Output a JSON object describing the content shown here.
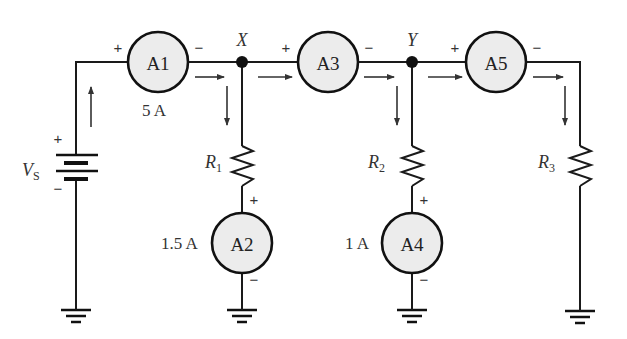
{
  "diagram": {
    "type": "circuit-schematic",
    "source": {
      "label": "V",
      "subscript": "S",
      "plus": "+",
      "minus": "−"
    },
    "nodes": [
      {
        "id": "X",
        "label": "X"
      },
      {
        "id": "Y",
        "label": "Y"
      }
    ],
    "ammeters": [
      {
        "id": "A1",
        "label": "A1",
        "reading": "5 A",
        "plus": "+",
        "minus": "−"
      },
      {
        "id": "A2",
        "label": "A2",
        "reading": "1.5 A",
        "plus": "+",
        "minus": "−"
      },
      {
        "id": "A3",
        "label": "A3",
        "reading": "",
        "plus": "+",
        "minus": "−"
      },
      {
        "id": "A4",
        "label": "A4",
        "reading": "1 A",
        "plus": "+",
        "minus": "−"
      },
      {
        "id": "A5",
        "label": "A5",
        "reading": "",
        "plus": "+",
        "minus": "−"
      }
    ],
    "resistors": [
      {
        "id": "R1",
        "label": "R",
        "subscript": "1"
      },
      {
        "id": "R2",
        "label": "R",
        "subscript": "2"
      },
      {
        "id": "R3",
        "label": "R",
        "subscript": "3"
      }
    ],
    "colors": {
      "wire": "#1a1a1a",
      "meter_fill": "#ececec",
      "text": "#333333"
    }
  }
}
